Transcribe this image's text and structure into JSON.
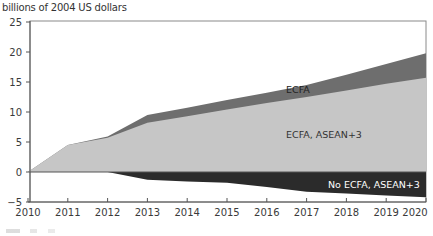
{
  "chart_data": {
    "type": "area",
    "title": "",
    "ylabel": "billions of 2004 US dollars",
    "xlabel": "",
    "x": [
      2010,
      2011,
      2012,
      2013,
      2014,
      2015,
      2016,
      2017,
      2018,
      2019,
      2020
    ],
    "ylim": [
      -5,
      25
    ],
    "yticks": [
      -5,
      0,
      5,
      10,
      15,
      20,
      25
    ],
    "xticks": [
      2010,
      2011,
      2012,
      2013,
      2014,
      2015,
      2016,
      2017,
      2018,
      2019,
      2020
    ],
    "grid": false,
    "legend_position": "inline labels",
    "series": [
      {
        "name": "ECFA",
        "color": "#6e6e6e",
        "values": [
          0,
          4.5,
          5.9,
          9.5,
          10.7,
          12.0,
          13.2,
          14.5,
          16.2,
          18.0,
          19.8
        ]
      },
      {
        "name": "ECFA, ASEAN+3",
        "color": "#c6c6c6",
        "values": [
          0,
          4.5,
          5.7,
          8.2,
          9.3,
          10.4,
          11.5,
          12.5,
          13.6,
          14.7,
          15.7
        ]
      },
      {
        "name": "No ECFA, ASEAN+3",
        "color": "#2b2b2b",
        "values": [
          0,
          0,
          0,
          -1.3,
          -1.6,
          -1.8,
          -2.5,
          -3.3,
          -3.6,
          -3.9,
          -4.2
        ]
      }
    ],
    "annotations": [
      {
        "text": "ECFA",
        "x": 2016.5,
        "y": 13.5
      },
      {
        "text": "ECFA, ASEAN+3",
        "x": 2016.5,
        "y": 6
      },
      {
        "text": "No ECFA, ASEAN+3",
        "x": 2018.7,
        "y": -2.2
      }
    ]
  },
  "labels": {
    "unit": "billions of 2004 US dollars",
    "ecfa": "ECFA",
    "ecfa_asean": "ECFA, ASEAN+3",
    "no_ecfa_asean": "No ECFA, ASEAN+3"
  },
  "axis": {
    "y": [
      "25",
      "20",
      "15",
      "10",
      "5",
      "0",
      "−5"
    ],
    "x": [
      "2010",
      "2011",
      "2012",
      "2013",
      "2014",
      "2015",
      "2016",
      "2017",
      "2018",
      "2019",
      "2020"
    ]
  }
}
